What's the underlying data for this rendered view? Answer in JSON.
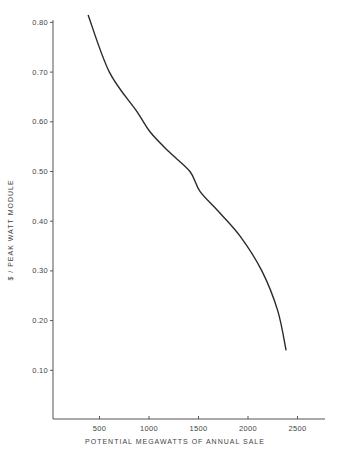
{
  "chart_data": {
    "type": "line",
    "title": "",
    "xlabel": "POTENTIAL MEGAWATTS OF ANNUAL SALE",
    "ylabel": "$ / PEAK WATT MODULE",
    "xlim": [
      0,
      2700
    ],
    "ylim": [
      0,
      0.8
    ],
    "x_ticks": [
      500,
      1000,
      1500,
      2000,
      2500
    ],
    "x_tick_labels": [
      "500",
      "1000",
      "1500",
      "2000",
      "2500"
    ],
    "y_ticks": [
      0.1,
      0.2,
      0.3,
      0.4,
      0.5,
      0.6,
      0.7,
      0.8
    ],
    "y_tick_labels": [
      "0.10",
      "0.20",
      "0.30",
      "0.40",
      "0.50",
      "0.60",
      "0.70",
      "0.80"
    ],
    "grid": false,
    "legend": null,
    "series": [
      {
        "name": "price curve",
        "x": [
          385,
          600,
          880,
          1010,
          1200,
          1414,
          1515,
          1700,
          1920,
          2140,
          2300,
          2385
        ],
        "y": [
          0.815,
          0.7,
          0.62,
          0.58,
          0.54,
          0.5,
          0.46,
          0.42,
          0.37,
          0.3,
          0.22,
          0.14
        ]
      }
    ]
  }
}
